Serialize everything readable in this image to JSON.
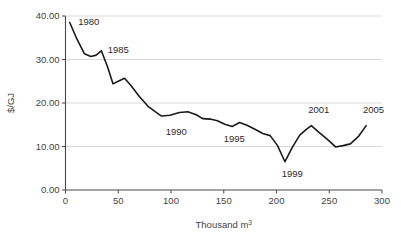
{
  "chart_data": {
    "type": "line",
    "title": "",
    "xlabel": "Thousand m3",
    "xlabel_display": "Thousand m",
    "xlabel_superscript": "3",
    "ylabel": "$/GJ",
    "xlim": [
      0,
      300
    ],
    "ylim": [
      0,
      40
    ],
    "grid": true,
    "grid_axis": "y",
    "legend": "none",
    "xticks": [
      0,
      50,
      100,
      150,
      200,
      250,
      300
    ],
    "xtick_labels": [
      "0",
      "50",
      "100",
      "150",
      "200",
      "250",
      "300"
    ],
    "yticks": [
      0,
      10,
      20,
      30,
      40
    ],
    "ytick_labels": [
      "0.00",
      "10.00",
      "20.00",
      "30.00",
      "40.00"
    ],
    "series": [
      {
        "name": "price",
        "color": "#1a1a1a",
        "x": [
          4,
          11,
          18,
          24,
          29,
          34,
          40,
          45,
          50,
          56,
          62,
          70,
          78,
          85,
          91,
          99,
          108,
          116,
          124,
          130,
          137,
          144,
          151,
          158,
          165,
          172,
          180,
          187,
          194,
          201,
          208,
          215,
          222,
          228,
          233,
          240,
          248,
          256,
          263,
          270,
          278,
          285
        ],
        "y": [
          38.5,
          34.6,
          31.3,
          30.7,
          31.0,
          32.0,
          28.2,
          24.4,
          25.0,
          25.7,
          24.0,
          21.5,
          19.3,
          18.0,
          17.0,
          17.2,
          17.8,
          18.0,
          17.3,
          16.4,
          16.3,
          15.9,
          15.1,
          14.6,
          15.5,
          14.9,
          13.9,
          13.0,
          12.5,
          10.2,
          6.5,
          9.8,
          12.6,
          13.9,
          14.8,
          13.3,
          11.7,
          9.9,
          10.2,
          10.6,
          12.4,
          14.8
        ]
      }
    ],
    "annotations": [
      {
        "label": "1980",
        "x": 12,
        "y": 38.0
      },
      {
        "label": "1985",
        "x": 40,
        "y": 31.5
      },
      {
        "label": "1990",
        "x": 95,
        "y": 12.6
      },
      {
        "label": "1995",
        "x": 150,
        "y": 11.0
      },
      {
        "label": "1999",
        "x": 205,
        "y": 3.0
      },
      {
        "label": "2001",
        "x": 230,
        "y": 17.6
      },
      {
        "label": "2005",
        "x": 282,
        "y": 17.6
      }
    ],
    "colors": {
      "line": "#1a1a1a",
      "axis": "#4a4a4a",
      "grid": "#d9d9d9",
      "text": "#3a3a3a",
      "background": "#ffffff"
    }
  }
}
